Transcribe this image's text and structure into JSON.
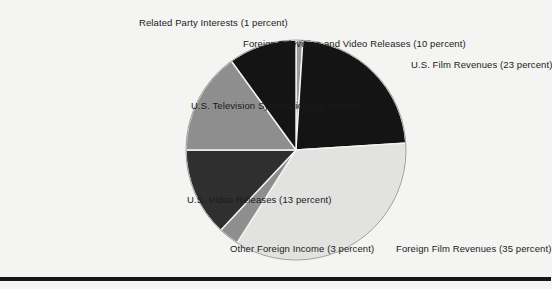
{
  "figure": {
    "background_color": "#f4f4f2",
    "rule_color": "#16161a",
    "text_color": "#1a1a1a"
  },
  "chart_data": {
    "type": "pie",
    "title": "",
    "subtitle": "",
    "xlabel": "",
    "ylabel": "",
    "legend_position": "none",
    "grid": false,
    "units": "percent",
    "total": 100,
    "start_angle_deg": 0,
    "direction": "clockwise",
    "center": {
      "x": 296,
      "y": 150
    },
    "radius": 110,
    "categories": [
      "Related Party Interests",
      "U.S. Film Revenues",
      "Foreign Film Revenues",
      "Other Foreign Income",
      "U.S. Video Releases",
      "U.S. Television Syndication",
      "Foreign Television and Video Releases"
    ],
    "values": [
      1,
      23,
      35,
      3,
      13,
      15,
      10
    ],
    "colors": [
      "#9a9a9a",
      "#141414",
      "#e2e2e0",
      "#8e8e8e",
      "#2f2f2f",
      "#8e8e8e",
      "#141414"
    ],
    "slices": [
      {
        "name": "Related Party Interests",
        "value": 1,
        "label": "Related Party Interests (1 percent)",
        "color": "#9a9a9a",
        "label_side": "top",
        "label_x": 139,
        "label_y": 17
      },
      {
        "name": "U.S. Film Revenues",
        "value": 23,
        "label": "U.S. Film Revenues (23 percent)",
        "color": "#141414",
        "label_side": "right",
        "label_x": 411,
        "label_y": 59
      },
      {
        "name": "Foreign Film Revenues",
        "value": 35,
        "label": "Foreign Film Revenues (35 percent)",
        "color": "#e2e2e0",
        "label_side": "right",
        "label_x": 396,
        "label_y": 243
      },
      {
        "name": "Other Foreign Income",
        "value": 3,
        "label": "Other Foreign Income (3 percent)",
        "color": "#8e8e8e",
        "label_side": "left",
        "label_x": 230,
        "label_y": 243
      },
      {
        "name": "U.S. Video Releases",
        "value": 13,
        "label": "U.S. Video Releases (13 percent)",
        "color": "#2f2f2f",
        "label_side": "left",
        "label_x": 187,
        "label_y": 194
      },
      {
        "name": "U.S. Television Syndication",
        "value": 15,
        "label": "U.S. Television Syndication (15 percent)",
        "color": "#8e8e8e",
        "label_side": "left",
        "label_x": 191,
        "label_y": 100
      },
      {
        "name": "Foreign Television and Video Releases",
        "value": 10,
        "label": "Foreign Television and Video Releases (10 percent)",
        "color": "#141414",
        "label_side": "left",
        "label_x": 243,
        "label_y": 38
      }
    ]
  }
}
